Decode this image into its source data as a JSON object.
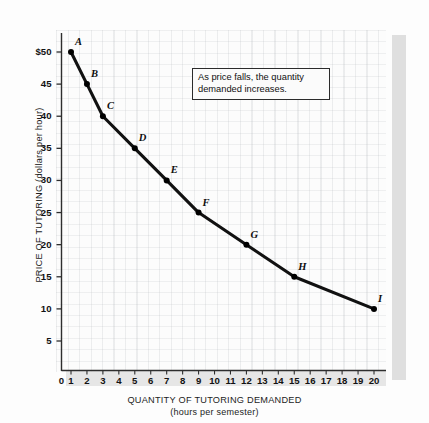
{
  "chart_data": {
    "type": "line",
    "title": "",
    "xlabel": "QUANTITY OF TUTORING DEMANDED",
    "xlabel_sub": "(hours per semester)",
    "ylabel": "PRICE OF TUTORING (dollars per hour)",
    "xlim": [
      0,
      20.6
    ],
    "ylim": [
      0,
      53
    ],
    "grid": true,
    "legend": "none",
    "x_ticks": [
      "0",
      "1",
      "2",
      "3",
      "4",
      "5",
      "6",
      "7",
      "8",
      "9",
      "10",
      "11",
      "12",
      "13",
      "14",
      "15",
      "16",
      "17",
      "18",
      "19",
      "20"
    ],
    "y_ticks": [
      "$50",
      "45",
      "40",
      "35",
      "30",
      "25",
      "20",
      "15",
      "10",
      "5"
    ],
    "y_tick_values": [
      50,
      45,
      40,
      35,
      30,
      25,
      20,
      15,
      10,
      5
    ],
    "series": [
      {
        "name": "Demand",
        "points": [
          {
            "label": "A",
            "x": 1,
            "y": 50
          },
          {
            "label": "B",
            "x": 2,
            "y": 45
          },
          {
            "label": "C",
            "x": 3,
            "y": 40
          },
          {
            "label": "D",
            "x": 5,
            "y": 35
          },
          {
            "label": "E",
            "x": 7,
            "y": 30
          },
          {
            "label": "F",
            "x": 9,
            "y": 25
          },
          {
            "label": "G",
            "x": 12,
            "y": 20
          },
          {
            "label": "H",
            "x": 15,
            "y": 15
          },
          {
            "label": "I",
            "x": 20,
            "y": 10
          }
        ]
      }
    ],
    "annotations": [
      {
        "name": "callout",
        "text": "As price falls, the quantity demanded increases."
      }
    ],
    "colors": {
      "line": "#111111",
      "marker": "#000000",
      "axis": "#333333",
      "text": "#111111"
    }
  }
}
